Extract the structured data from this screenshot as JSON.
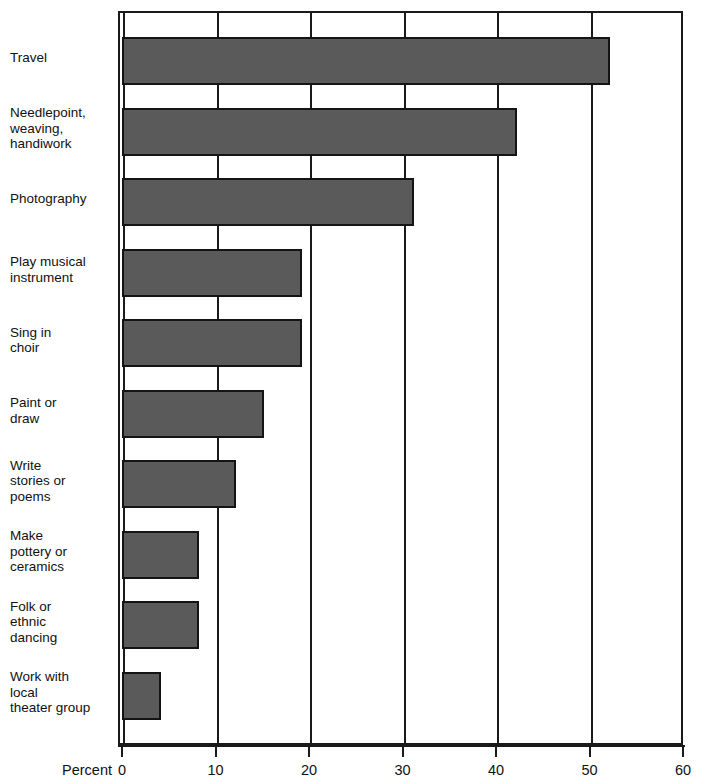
{
  "chart_data": {
    "type": "bar",
    "orientation": "horizontal",
    "title": "",
    "xlabel": "Percent",
    "ylabel": "",
    "xlim": [
      0,
      60
    ],
    "xticks": [
      0,
      10,
      20,
      30,
      40,
      50,
      60
    ],
    "xtick_labels": [
      "0",
      "10",
      "20",
      "30",
      "40",
      "50",
      "60"
    ],
    "grid": true,
    "legend": null,
    "categories": [
      "Travel",
      "Needlepoint,\nweaving,\nhandiwork",
      "Photography",
      "Play musical\ninstrument",
      "Sing in\nchoir",
      "Paint or\ndraw",
      "Write\nstories or\npoems",
      "Make\npottery or\nceramics",
      "Folk or\nethnic\ndancing",
      "Work with\nlocal\ntheater group"
    ],
    "values": [
      52,
      42,
      31,
      19,
      19,
      15,
      12,
      8,
      8,
      4
    ],
    "bar_color": "#5a5a5a",
    "bar_edge_color": "#141414",
    "axis_color": "#1a1a1a",
    "background_color": "#ffffff"
  },
  "axis": {
    "x_title": "Percent"
  }
}
